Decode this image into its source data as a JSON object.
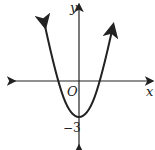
{
  "diagram": {
    "type": "parabola-graph",
    "axes": {
      "x_label": "x",
      "y_label": "y",
      "origin_label": "O"
    },
    "annotations": {
      "y_intercept_label": "−3"
    },
    "curve": {
      "shape": "upward-opening parabola",
      "vertex_y": -3,
      "color": "#222222"
    }
  }
}
